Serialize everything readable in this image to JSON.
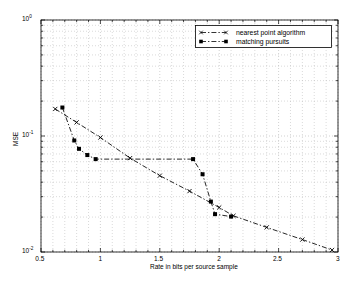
{
  "chart_data": {
    "type": "line",
    "title": "",
    "xlabel": "Rate in bits per source sample",
    "ylabel": "MSE",
    "xscale": "linear",
    "yscale": "log",
    "xlim": [
      0.5,
      3
    ],
    "ylim": [
      0.01,
      1
    ],
    "grid": true,
    "grid_style": "dotted-minor-log",
    "legend_position": "top-right",
    "xticks": [
      "0.5",
      "1",
      "1.5",
      "2",
      "2.5",
      "3"
    ],
    "xtick_values": [
      0.5,
      1,
      1.5,
      2,
      2.5,
      3
    ],
    "yticks": [
      "10",
      "10",
      "10"
    ],
    "ytick_exponents": [
      "0",
      "-1",
      "-2"
    ],
    "ytick_values": [
      1,
      0.1,
      0.01
    ],
    "series": [
      {
        "name": "nearest point algorithm",
        "marker": "x",
        "linestyle": "dash-dot",
        "color": "#000000",
        "points": [
          [
            0.62,
            0.171
          ],
          [
            0.8,
            0.131
          ],
          [
            1.0,
            0.097
          ],
          [
            1.25,
            0.0645
          ],
          [
            1.5,
            0.0455
          ],
          [
            1.75,
            0.0335
          ],
          [
            2.0,
            0.0242
          ],
          [
            2.12,
            0.0205
          ],
          [
            2.4,
            0.0163
          ],
          [
            2.7,
            0.0128
          ],
          [
            2.95,
            0.0104
          ]
        ]
      },
      {
        "name": "matching pursuits",
        "marker": "s",
        "linestyle": "dash-dot",
        "color": "#000000",
        "points": [
          [
            0.68,
            0.176
          ],
          [
            0.78,
            0.0915
          ],
          [
            0.82,
            0.0775
          ],
          [
            0.89,
            0.0685
          ],
          [
            0.96,
            0.0632
          ],
          [
            1.78,
            0.0632
          ],
          [
            1.86,
            0.0468
          ],
          [
            1.93,
            0.0272
          ],
          [
            1.965,
            0.0212
          ],
          [
            2.1,
            0.0202
          ]
        ]
      }
    ]
  },
  "legend": {
    "entries": [
      {
        "label": "nearest point algorithm",
        "marker": "x"
      },
      {
        "label": "matching pursuits",
        "marker": "square"
      }
    ]
  },
  "axes": {
    "x_title": "Rate in bits per source sample",
    "y_title": "MSE",
    "x_tick_labels": [
      "0.5",
      "1",
      "1.5",
      "2",
      "2.5",
      "3"
    ],
    "y_tick_base": "10",
    "y_tick_exponents": [
      "0",
      "-1",
      "-2"
    ]
  },
  "colors": {
    "line": "#000000",
    "grid": "#b4b4b4",
    "frame": "#000000",
    "background": "#ffffff"
  }
}
